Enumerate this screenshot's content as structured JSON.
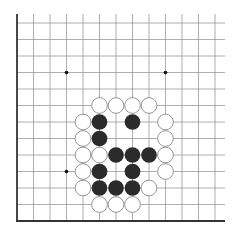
{
  "diagram": {
    "type": "go-board-corner",
    "corner": "bottom-left",
    "columns": 13,
    "rows": 13,
    "origin_x": 17,
    "origin_y": 221,
    "spacing": 16.5,
    "line_color": "#9a9a9a",
    "edge_color": "#333333",
    "star_points": [
      [
        3,
        3
      ],
      [
        3,
        9
      ],
      [
        9,
        9
      ]
    ],
    "stones": {
      "white": [
        [
          5,
          7
        ],
        [
          6,
          7
        ],
        [
          7,
          7
        ],
        [
          8,
          7
        ],
        [
          4,
          6
        ],
        [
          9,
          6
        ],
        [
          4,
          5
        ],
        [
          9,
          5
        ],
        [
          4,
          4
        ],
        [
          5,
          4
        ],
        [
          9,
          4
        ],
        [
          4,
          3
        ],
        [
          9,
          3
        ],
        [
          4,
          2
        ],
        [
          8,
          2
        ],
        [
          5,
          1
        ],
        [
          6,
          1
        ],
        [
          7,
          1
        ]
      ],
      "black": [
        [
          5,
          6
        ],
        [
          7,
          6
        ],
        [
          5,
          5
        ],
        [
          6,
          4
        ],
        [
          7,
          4
        ],
        [
          8,
          4
        ],
        [
          5,
          3
        ],
        [
          7,
          3
        ],
        [
          5,
          2
        ],
        [
          6,
          2
        ],
        [
          7,
          2
        ]
      ]
    },
    "colors": {
      "black_stone": "#2b2b2b",
      "white_stone": "#ffffff",
      "white_outline": "#8a8a8a"
    }
  }
}
